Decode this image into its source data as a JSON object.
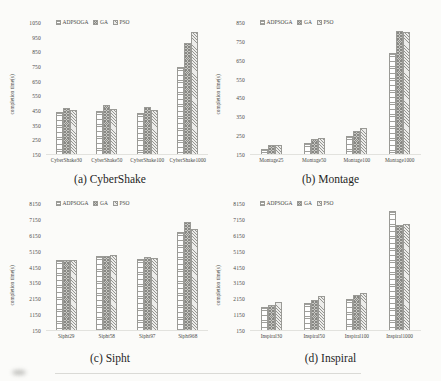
{
  "page": {
    "background": "#fbfbf9"
  },
  "colors": {
    "bar_border": "#9a9a96",
    "adpsoga_fill": "#ffffff",
    "ga_fill": "#c6c6c2",
    "pso_fill": "#ececea",
    "text": "#4a4a48"
  },
  "chart_data": [
    {
      "id": "cybershake",
      "type": "bar",
      "caption": "(a) CyberShake",
      "ylabel": "completion time(s)",
      "ylim": [
        150,
        1050
      ],
      "yticks": [
        150,
        250,
        350,
        450,
        550,
        650,
        750,
        850,
        950,
        1050
      ],
      "grid": false,
      "legend_position": "top-left-inside",
      "categories": [
        "CyberShake30",
        "CyberShake50",
        "CyberShake100",
        "CyberShake1000"
      ],
      "series": [
        {
          "name": "ADPSOGA",
          "pattern": "horizontal-lines",
          "values": [
            440,
            445,
            430,
            745
          ]
        },
        {
          "name": "GA",
          "pattern": "crosshatch",
          "values": [
            465,
            485,
            470,
            915
          ]
        },
        {
          "name": "PSO",
          "pattern": "diagonal-lines",
          "values": [
            450,
            460,
            455,
            990
          ]
        }
      ]
    },
    {
      "id": "montage",
      "type": "bar",
      "caption": "(b) Montage",
      "ylabel": "completion time(s)",
      "ylim": [
        150,
        850
      ],
      "yticks": [
        150,
        250,
        350,
        450,
        550,
        650,
        750,
        850
      ],
      "grid": false,
      "legend_position": "top-left-inside",
      "categories": [
        "Montage25",
        "Montage50",
        "Montage100",
        "Montage1000"
      ],
      "series": [
        {
          "name": "ADPSOGA",
          "pattern": "horizontal-lines",
          "values": [
            178,
            210,
            245,
            688
          ]
        },
        {
          "name": "GA",
          "pattern": "crosshatch",
          "values": [
            200,
            230,
            272,
            805
          ]
        },
        {
          "name": "PSO",
          "pattern": "diagonal-lines",
          "values": [
            198,
            238,
            287,
            800
          ]
        }
      ]
    },
    {
      "id": "sipht",
      "type": "bar",
      "caption": "(c) Sipht",
      "ylabel": "completion time(s)",
      "ylim": [
        150,
        8150
      ],
      "yticks": [
        150,
        1150,
        2150,
        3150,
        4150,
        5150,
        6150,
        7150,
        8150
      ],
      "grid": false,
      "legend_position": "top-left-inside",
      "categories": [
        "Sipht29",
        "Sipht58",
        "Sipht97",
        "Sipht968"
      ],
      "series": [
        {
          "name": "ADPSOGA",
          "pattern": "horizontal-lines",
          "values": [
            4580,
            4850,
            4690,
            6390
          ]
        },
        {
          "name": "GA",
          "pattern": "crosshatch",
          "values": [
            4620,
            4850,
            4810,
            7020
          ]
        },
        {
          "name": "PSO",
          "pattern": "diagonal-lines",
          "values": [
            4600,
            4915,
            4710,
            6560
          ]
        }
      ]
    },
    {
      "id": "inspiral",
      "type": "bar",
      "caption": "(d) Inspiral",
      "ylabel": "completion time(s)",
      "ylim": [
        150,
        8150
      ],
      "yticks": [
        150,
        1150,
        2150,
        3150,
        4150,
        5150,
        6150,
        7150,
        8150
      ],
      "grid": false,
      "legend_position": "top-left-inside",
      "categories": [
        "Inspiral30",
        "Inspiral50",
        "Inspiral100",
        "Inspiral1000"
      ],
      "series": [
        {
          "name": "ADPSOGA",
          "pattern": "horizontal-lines",
          "values": [
            1590,
            1855,
            2150,
            7730
          ]
        },
        {
          "name": "GA",
          "pattern": "crosshatch",
          "values": [
            1750,
            2040,
            2375,
            6835
          ]
        },
        {
          "name": "PSO",
          "pattern": "diagonal-lines",
          "values": [
            1920,
            2340,
            2480,
            6900
          ]
        }
      ]
    }
  ]
}
